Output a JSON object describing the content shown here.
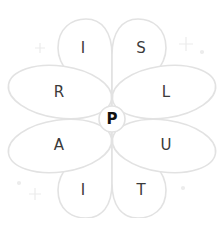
{
  "game": {
    "center_letter": "P",
    "petals": [
      {
        "letter": "I",
        "x": 83,
        "y": 48
      },
      {
        "letter": "S",
        "x": 141,
        "y": 48
      },
      {
        "letter": "R",
        "x": 59,
        "y": 92
      },
      {
        "letter": "L",
        "x": 166,
        "y": 92
      },
      {
        "letter": "A",
        "x": 59,
        "y": 145
      },
      {
        "letter": "U",
        "x": 166,
        "y": 145
      },
      {
        "letter": "I",
        "x": 83,
        "y": 190
      },
      {
        "letter": "T",
        "x": 141,
        "y": 190
      }
    ]
  },
  "colors": {
    "petal_stroke": "#e4e4e4",
    "sparkle": "#ececec",
    "text": "#3a3a3a"
  }
}
